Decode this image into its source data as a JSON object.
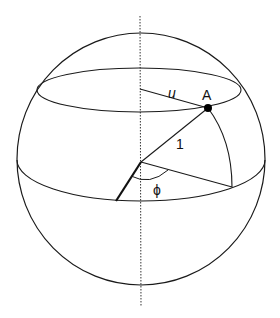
{
  "diagram": {
    "type": "sphere-geometry",
    "colors": {
      "stroke": "#1a1a1a",
      "background": "#ffffff",
      "point": "#000000"
    },
    "labels": {
      "point": "A",
      "radius": "1",
      "parallel_radius": "u",
      "angle": "ϕ"
    }
  }
}
